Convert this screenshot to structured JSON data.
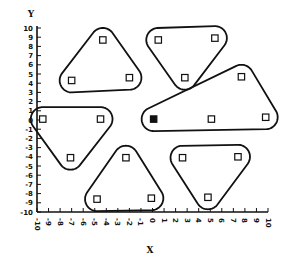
{
  "chart_data": {
    "type": "scatter",
    "title": "",
    "xlabel": "X",
    "ylabel": "Y",
    "xlim": [
      -10,
      10
    ],
    "ylim": [
      -10,
      10
    ],
    "xticks": [
      -10,
      -9,
      -8,
      -7,
      -6,
      -5,
      -4,
      -3,
      -2,
      -1,
      0,
      1,
      2,
      3,
      4,
      5,
      6,
      7,
      8,
      9,
      10
    ],
    "yticks": [
      -10,
      -9,
      -8,
      -7,
      -6,
      -5,
      -4,
      -3,
      -2,
      -1,
      0,
      1,
      2,
      3,
      4,
      5,
      6,
      7,
      8,
      9,
      10
    ],
    "xtick_labels": [
      "-10",
      "-9",
      "-8",
      "-7",
      "-6",
      "-5",
      "-4",
      "-3",
      "-2",
      "-1",
      "0",
      "1",
      "2",
      "3",
      "4",
      "5",
      "6",
      "7",
      "8",
      "9",
      "10"
    ],
    "ytick_labels": [
      "-10",
      "-9",
      "-8",
      "-7",
      "-6",
      "-5",
      "-4",
      "-3",
      "-2",
      "-1",
      "0",
      "1",
      "2",
      "3",
      "4",
      "5",
      "6",
      "7",
      "8",
      "9",
      "10"
    ],
    "grid": false,
    "legend": null,
    "marker": "open-square",
    "clusters": [
      {
        "name": "cluster-top-left",
        "points": [
          [
            -4.3,
            8.7
          ],
          [
            -7.0,
            4.3
          ],
          [
            -2.0,
            4.6
          ]
        ]
      },
      {
        "name": "cluster-top-center",
        "points": [
          [
            0.5,
            8.7
          ],
          [
            5.4,
            8.9
          ],
          [
            2.8,
            4.6
          ]
        ]
      },
      {
        "name": "cluster-right",
        "points": [
          [
            7.7,
            4.7
          ],
          [
            0.1,
            0.1
          ],
          [
            5.1,
            0.1
          ],
          [
            9.8,
            0.3
          ]
        ]
      },
      {
        "name": "cluster-left",
        "points": [
          [
            -9.5,
            0.1
          ],
          [
            -4.5,
            0.1
          ],
          [
            -7.1,
            -4.1
          ]
        ]
      },
      {
        "name": "cluster-bottom-center",
        "points": [
          [
            -2.3,
            -4.1
          ],
          [
            -4.8,
            -8.6
          ],
          [
            -0.1,
            -8.5
          ]
        ]
      },
      {
        "name": "cluster-bottom-right",
        "points": [
          [
            2.6,
            -4.1
          ],
          [
            7.4,
            -4.0
          ],
          [
            4.8,
            -8.4
          ]
        ]
      }
    ],
    "highlighted_point": {
      "x": 0.1,
      "y": 0.1,
      "style": "filled-square"
    }
  }
}
